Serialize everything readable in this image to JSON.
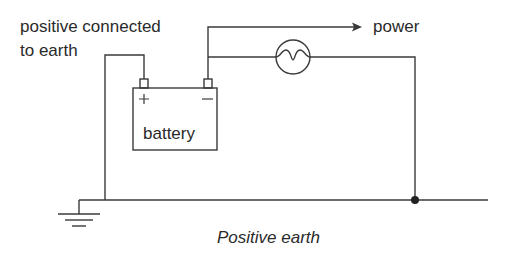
{
  "diagram": {
    "type": "circuit",
    "caption": "Positive earth",
    "labels": {
      "positive_note_line1": "positive connected",
      "positive_note_line2": "to earth",
      "power": "power",
      "battery": "battery",
      "plus_terminal": "+",
      "minus_terminal": "−"
    },
    "components": [
      {
        "id": "battery",
        "label": "battery",
        "terminals": [
          "+",
          "−"
        ]
      },
      {
        "id": "lamp",
        "symbol": "lamp-circle"
      },
      {
        "id": "earth",
        "symbol": "ground"
      },
      {
        "id": "junction",
        "symbol": "dot"
      }
    ],
    "connections": [
      {
        "from": "battery.+",
        "to": "earth"
      },
      {
        "from": "battery.−",
        "to": "power",
        "arrow": true
      },
      {
        "from": "battery.−",
        "to": "lamp"
      },
      {
        "from": "lamp",
        "to": "junction"
      },
      {
        "from": "junction",
        "to": "earth"
      }
    ],
    "colors": {
      "line": "#3a3a3a",
      "text": "#2a2a2a",
      "background": "#ffffff"
    }
  }
}
